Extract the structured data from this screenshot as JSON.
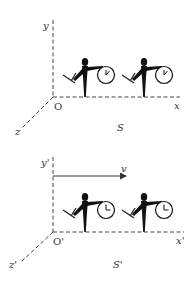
{
  "frames": [
    {
      "name": "S",
      "labels": {
        "x": "x",
        "y": "y",
        "z": "z",
        "origin": "O",
        "frame": "S"
      },
      "velocity_arrow": null,
      "observers": [
        {
          "clock_hand": "two-o-clock"
        },
        {
          "clock_hand": "two-o-clock"
        }
      ]
    },
    {
      "name": "S'",
      "labels": {
        "x": "x'",
        "y": "y'",
        "z": "z'",
        "origin": "O'",
        "frame": "S'"
      },
      "velocity_arrow": {
        "label": "v",
        "direction": "+x"
      },
      "observers": [
        {
          "clock_hand": "three-o-clock"
        },
        {
          "clock_hand": "three-o-clock"
        }
      ]
    }
  ],
  "colors": {
    "ink": "#111111",
    "axis": "#444444",
    "label": "#333333"
  }
}
